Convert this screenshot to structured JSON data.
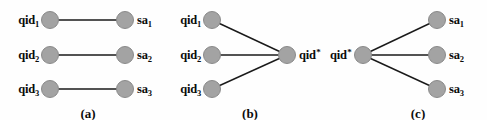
{
  "figure": {
    "width": 487,
    "height": 120,
    "background_color": "#fefefe",
    "node_fill_color": "#a3a3a3",
    "node_stroke_color": "#8a8a8a",
    "edge_color": "#1a1a1a",
    "text_color": "#0b0b0b"
  },
  "panels": [
    {
      "id": "a",
      "caption": "(a)",
      "caption_x": 88,
      "caption_y": 106,
      "description": "one-to-one mapping between qid nodes and sa nodes",
      "nodes": [
        {
          "id": "a-qid-1",
          "name": "qid-node-1",
          "label_base": "qid",
          "label_sub": "1",
          "label_sup": "",
          "x": 50,
          "y": 20,
          "label_x": 39,
          "label_y": 20,
          "label_side": "left"
        },
        {
          "id": "a-qid-2",
          "name": "qid-node-2",
          "label_base": "qid",
          "label_sub": "2",
          "label_sup": "",
          "x": 50,
          "y": 55,
          "label_x": 39,
          "label_y": 55,
          "label_side": "left"
        },
        {
          "id": "a-qid-3",
          "name": "qid-node-3",
          "label_base": "qid",
          "label_sub": "3",
          "label_sup": "",
          "x": 50,
          "y": 89,
          "label_x": 39,
          "label_y": 89,
          "label_side": "left"
        },
        {
          "id": "a-sa-1",
          "name": "sa-node-1",
          "label_base": "sa",
          "label_sub": "1",
          "label_sup": "",
          "x": 125,
          "y": 20,
          "label_x": 137,
          "label_y": 20,
          "label_side": "right"
        },
        {
          "id": "a-sa-2",
          "name": "sa-node-2",
          "label_base": "sa",
          "label_sub": "2",
          "label_sup": "",
          "x": 125,
          "y": 55,
          "label_x": 137,
          "label_y": 55,
          "label_side": "right"
        },
        {
          "id": "a-sa-3",
          "name": "sa-node-3",
          "label_base": "sa",
          "label_sub": "3",
          "label_sup": "",
          "x": 125,
          "y": 89,
          "label_x": 137,
          "label_y": 89,
          "label_side": "right"
        }
      ],
      "edges": [
        {
          "name": "edge-qid1-sa1",
          "x1": 50,
          "y1": 20,
          "x2": 125,
          "y2": 20
        },
        {
          "name": "edge-qid2-sa2",
          "x1": 50,
          "y1": 55,
          "x2": 125,
          "y2": 55
        },
        {
          "name": "edge-qid3-sa3",
          "x1": 50,
          "y1": 89,
          "x2": 125,
          "y2": 89
        }
      ]
    },
    {
      "id": "b",
      "caption": "(b)",
      "caption_x": 250,
      "caption_y": 106,
      "description": "three qid nodes converging to a single generalized qid* node",
      "nodes": [
        {
          "id": "b-qid-1",
          "name": "qid-node-1",
          "label_base": "qid",
          "label_sub": "1",
          "label_sup": "",
          "x": 212,
          "y": 20,
          "label_x": 201,
          "label_y": 20,
          "label_side": "left"
        },
        {
          "id": "b-qid-2",
          "name": "qid-node-2",
          "label_base": "qid",
          "label_sub": "2",
          "label_sup": "",
          "x": 212,
          "y": 55,
          "label_x": 201,
          "label_y": 55,
          "label_side": "left"
        },
        {
          "id": "b-qid-3",
          "name": "qid-node-3",
          "label_base": "qid",
          "label_sub": "3",
          "label_sup": "",
          "x": 212,
          "y": 89,
          "label_x": 201,
          "label_y": 89,
          "label_side": "left"
        },
        {
          "id": "b-qid-star",
          "name": "qid-star-node",
          "label_base": "qid",
          "label_sub": "",
          "label_sup": "*",
          "x": 287,
          "y": 55,
          "label_x": 299,
          "label_y": 55,
          "label_side": "right"
        }
      ],
      "edges": [
        {
          "name": "edge-qid1-qidstar",
          "x1": 212,
          "y1": 20,
          "x2": 287,
          "y2": 55
        },
        {
          "name": "edge-qid2-qidstar",
          "x1": 212,
          "y1": 55,
          "x2": 287,
          "y2": 55
        },
        {
          "name": "edge-qid3-qidstar",
          "x1": 212,
          "y1": 89,
          "x2": 287,
          "y2": 55
        }
      ]
    },
    {
      "id": "c",
      "caption": "(c)",
      "caption_x": 418,
      "caption_y": 106,
      "description": "a single generalized qid* node fanning out to three sa nodes",
      "nodes": [
        {
          "id": "c-qid-star",
          "name": "qid-star-node",
          "label_base": "qid",
          "label_sub": "",
          "label_sup": "*",
          "x": 363,
          "y": 55,
          "label_x": 351,
          "label_y": 55,
          "label_side": "left"
        },
        {
          "id": "c-sa-1",
          "name": "sa-node-1",
          "label_base": "sa",
          "label_sub": "1",
          "label_sup": "",
          "x": 437,
          "y": 20,
          "label_x": 449,
          "label_y": 20,
          "label_side": "right"
        },
        {
          "id": "c-sa-2",
          "name": "sa-node-2",
          "label_base": "sa",
          "label_sub": "2",
          "label_sup": "",
          "x": 437,
          "y": 55,
          "label_x": 449,
          "label_y": 55,
          "label_side": "right"
        },
        {
          "id": "c-sa-3",
          "name": "sa-node-3",
          "label_base": "sa",
          "label_sub": "3",
          "label_sup": "",
          "x": 437,
          "y": 89,
          "label_x": 449,
          "label_y": 89,
          "label_side": "right"
        }
      ],
      "edges": [
        {
          "name": "edge-qidstar-sa1",
          "x1": 363,
          "y1": 55,
          "x2": 437,
          "y2": 20
        },
        {
          "name": "edge-qidstar-sa2",
          "x1": 363,
          "y1": 55,
          "x2": 437,
          "y2": 55
        },
        {
          "name": "edge-qidstar-sa3",
          "x1": 363,
          "y1": 55,
          "x2": 437,
          "y2": 89
        }
      ]
    }
  ]
}
